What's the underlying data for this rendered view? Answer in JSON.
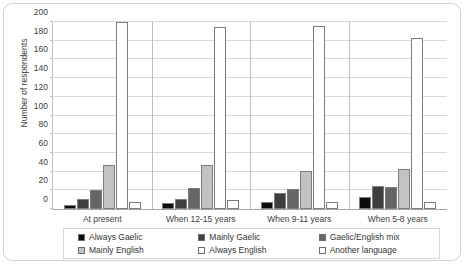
{
  "chart_data": {
    "type": "bar",
    "title": "",
    "xlabel": "",
    "ylabel": "Number of respondents",
    "ylim": [
      0,
      200
    ],
    "ytick_step": 20,
    "yticks": [
      0,
      20,
      40,
      60,
      80,
      100,
      120,
      140,
      160,
      180,
      200
    ],
    "grid": true,
    "legend_position": "bottom",
    "categories": [
      "At present",
      "When 12-15 years",
      "When 9-11 years",
      "When 5-8 years"
    ],
    "series": [
      {
        "name": "Always Gaelic",
        "color": "#0d0d0d",
        "values": [
          4,
          6,
          8,
          13
        ]
      },
      {
        "name": "Mainly Gaelic",
        "color": "#3f3f3f",
        "values": [
          11,
          11,
          17,
          25
        ]
      },
      {
        "name": "Gaelic/English mix",
        "color": "#666666",
        "values": [
          20,
          23,
          21,
          24
        ]
      },
      {
        "name": "Mainly English",
        "color": "#c2c2c2",
        "values": [
          47,
          47,
          41,
          43
        ]
      },
      {
        "name": "Always English",
        "color": "#ffffff",
        "values": [
          200,
          195,
          196,
          183
        ]
      },
      {
        "name": "Another language",
        "color": "#ffffff",
        "values": [
          8,
          10,
          8,
          8
        ]
      }
    ]
  },
  "legend": {
    "items": [
      {
        "label": "Always Gaelic"
      },
      {
        "label": "Mainly Gaelic"
      },
      {
        "label": "Gaelic/English mix"
      },
      {
        "label": "Mainly English"
      },
      {
        "label": "Always English"
      },
      {
        "label": "Another language"
      }
    ]
  }
}
